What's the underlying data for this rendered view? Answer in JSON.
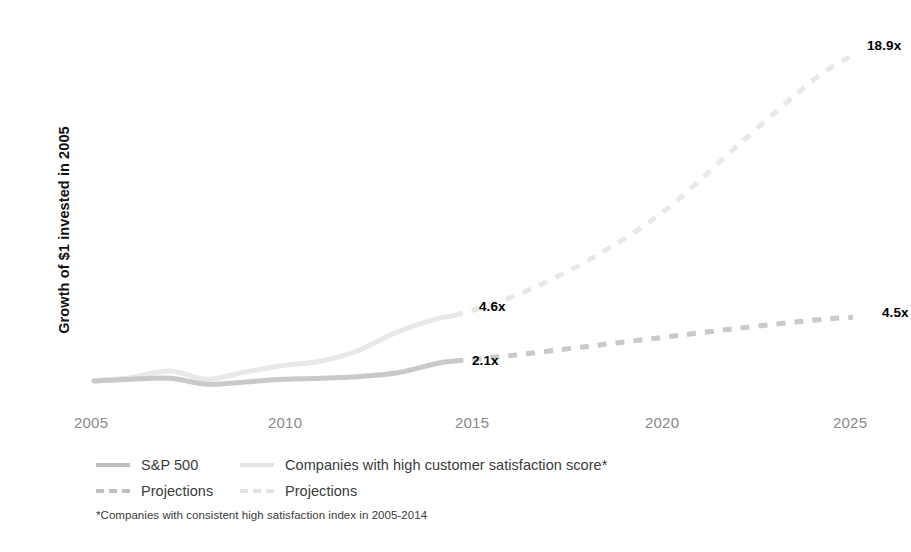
{
  "chart_data": {
    "type": "line",
    "title": "",
    "xlabel": "",
    "ylabel": "Growth of $1 invested in 2005",
    "xlim": [
      2005,
      2025
    ],
    "ylim": [
      0,
      20
    ],
    "grid": false,
    "legend_position": "bottom-left",
    "tick_labels": {
      "x": [
        "2005",
        "2010",
        "2015",
        "2020",
        "2025"
      ],
      "x_values": [
        2005,
        2010,
        2015,
        2020,
        2025
      ]
    },
    "series": [
      {
        "name": "S&P 500",
        "style": "solid",
        "color": "#c9c9c9",
        "x": [
          2005,
          2006,
          2007,
          2008,
          2009,
          2010,
          2011,
          2012,
          2013,
          2014,
          2014.5
        ],
        "values": [
          1.0,
          1.1,
          1.15,
          0.82,
          0.95,
          1.1,
          1.15,
          1.25,
          1.45,
          1.95,
          2.1
        ]
      },
      {
        "name": "Projections",
        "style": "dashed",
        "color": "#c9c9c9",
        "x": [
          2014.5,
          2016,
          2018,
          2020,
          2022,
          2024,
          2025
        ],
        "values": [
          2.1,
          2.4,
          2.9,
          3.4,
          3.9,
          4.35,
          4.5
        ]
      },
      {
        "name": "Companies with high customer satisfaction score*",
        "style": "solid",
        "color": "#e8e8e8",
        "x": [
          2005,
          2006,
          2007,
          2008,
          2009,
          2010,
          2011,
          2012,
          2013,
          2014,
          2014.5
        ],
        "values": [
          1.0,
          1.2,
          1.55,
          1.1,
          1.5,
          1.85,
          2.1,
          2.7,
          3.7,
          4.4,
          4.6
        ]
      },
      {
        "name": "Projections",
        "style": "dashed",
        "color": "#e8e8e8",
        "x": [
          2014.5,
          2016,
          2018,
          2020,
          2022,
          2024,
          2025
        ],
        "values": [
          4.6,
          5.6,
          7.6,
          10.3,
          14.0,
          17.6,
          18.9
        ]
      }
    ],
    "annotations": [
      {
        "text": "18.9x",
        "x": 2025,
        "y": 18.9,
        "series": "Companies with high customer satisfaction score*"
      },
      {
        "text": "4.5x",
        "x": 2025,
        "y": 4.5,
        "series": "S&P 500"
      },
      {
        "text": "4.6x",
        "x": 2014.5,
        "y": 4.6,
        "series": "Companies with high customer satisfaction score*"
      },
      {
        "text": "2.1x",
        "x": 2014.5,
        "y": 2.1,
        "series": "S&P 500"
      }
    ]
  },
  "axes": {
    "y_title": "Growth of $1 invested in 2005",
    "x_ticks": [
      {
        "label": "2005",
        "left": 74
      },
      {
        "label": "2010",
        "left": 268
      },
      {
        "label": "2015",
        "left": 455
      },
      {
        "label": "2020",
        "left": 645
      },
      {
        "label": "2025",
        "left": 833
      }
    ]
  },
  "value_labels": {
    "satisfaction_2025": "18.9x",
    "satisfaction_2014": "4.6x",
    "sp500_2025": "4.5x",
    "sp500_2014": "2.1x"
  },
  "legend": {
    "rows": [
      {
        "col1": {
          "label": "S&P 500",
          "swatch": "solid-dark"
        },
        "col2": {
          "label": "Companies with high customer satisfaction score*",
          "swatch": "solid-light"
        }
      },
      {
        "col1": {
          "label": "Projections",
          "swatch": "dash-dark"
        },
        "col2": {
          "label": "Projections",
          "swatch": "dash-light"
        }
      }
    ]
  },
  "footnote": {
    "text": "*Companies with consistent high satisfaction index in 2005-2014"
  },
  "colors": {
    "sp500": "#c9c9c9",
    "satisfaction": "#e8e8e8",
    "label_text": "#000000",
    "tick_text": "#8a8a8a",
    "legend_text": "#3b3b3b",
    "background": "#ffffff"
  }
}
